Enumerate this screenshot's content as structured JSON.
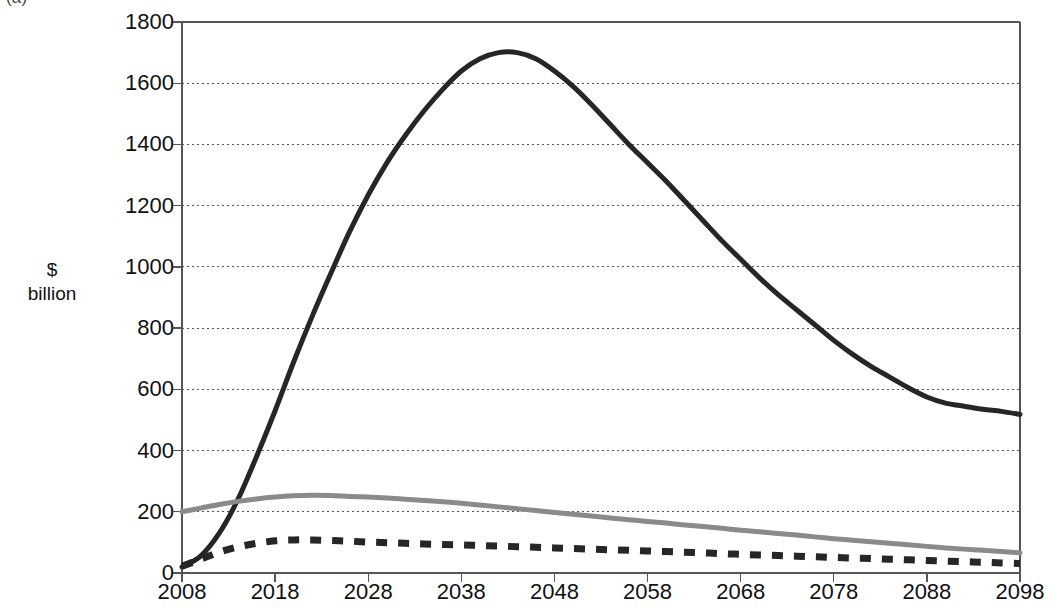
{
  "figure": {
    "panel_label": "(a)",
    "caption_partial": "(cut off above crop)",
    "y_axis_title_line1": "$",
    "y_axis_title_line2": "billion"
  },
  "chart_data": {
    "type": "line",
    "title": "",
    "xlabel": "",
    "ylabel": "$ billion",
    "xlim": [
      2008,
      2098
    ],
    "ylim": [
      0,
      1800
    ],
    "grid": true,
    "legend": "none",
    "xticks": [
      2008,
      2018,
      2028,
      2038,
      2048,
      2058,
      2068,
      2078,
      2088,
      2098
    ],
    "yticks": [
      0,
      200,
      400,
      600,
      800,
      1000,
      1200,
      1400,
      1600,
      1800
    ],
    "x": [
      2008,
      2010,
      2012,
      2014,
      2016,
      2018,
      2020,
      2022,
      2024,
      2026,
      2028,
      2030,
      2032,
      2034,
      2036,
      2038,
      2040,
      2042,
      2044,
      2046,
      2048,
      2050,
      2052,
      2054,
      2056,
      2058,
      2060,
      2062,
      2064,
      2066,
      2068,
      2070,
      2072,
      2074,
      2076,
      2078,
      2080,
      2082,
      2084,
      2086,
      2088,
      2090,
      2092,
      2094,
      2096,
      2098
    ],
    "series": [
      {
        "name": "series-black-solid",
        "style": "solid",
        "color": "#262626",
        "width": 5,
        "values": [
          20,
          55,
          130,
          240,
          380,
          530,
          690,
          840,
          980,
          1115,
          1235,
          1340,
          1430,
          1510,
          1580,
          1640,
          1680,
          1700,
          1700,
          1680,
          1640,
          1590,
          1530,
          1465,
          1400,
          1340,
          1280,
          1215,
          1150,
          1085,
          1025,
          965,
          910,
          860,
          810,
          760,
          715,
          675,
          640,
          605,
          575,
          555,
          545,
          535,
          528,
          518
        ]
      },
      {
        "name": "series-gray-solid",
        "style": "solid",
        "color": "#8a8a8a",
        "width": 5,
        "values": [
          200,
          212,
          224,
          234,
          242,
          248,
          252,
          254,
          253,
          250,
          248,
          245,
          241,
          237,
          233,
          228,
          222,
          216,
          210,
          204,
          198,
          192,
          186,
          180,
          174,
          168,
          163,
          157,
          152,
          146,
          140,
          135,
          129,
          124,
          118,
          112,
          107,
          102,
          97,
          92,
          87,
          82,
          78,
          74,
          70,
          66
        ]
      },
      {
        "name": "series-black-dashed",
        "style": "dashed",
        "color": "#262626",
        "width": 7,
        "values": [
          22,
          45,
          68,
          85,
          97,
          105,
          108,
          108,
          106,
          104,
          101,
          99,
          97,
          95,
          93,
          92,
          90,
          88,
          86,
          84,
          82,
          80,
          78,
          76,
          74,
          72,
          70,
          68,
          66,
          63,
          61,
          59,
          57,
          55,
          53,
          51,
          49,
          47,
          45,
          43,
          41,
          39,
          37,
          35,
          33,
          31
        ]
      }
    ]
  },
  "plot_geometry": {
    "left": 182,
    "right": 1020,
    "top": 22,
    "bottom": 573
  }
}
